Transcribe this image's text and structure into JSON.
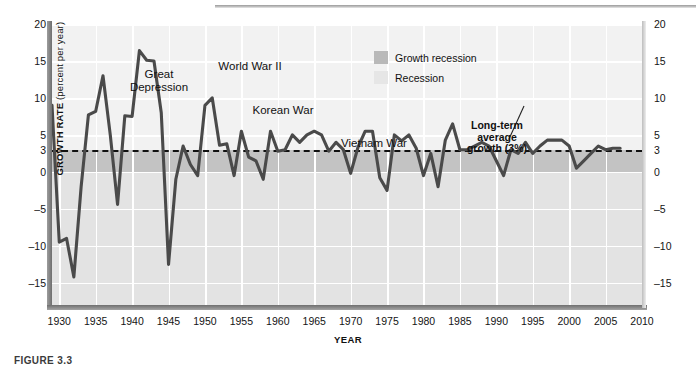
{
  "figure": {
    "caption": "FIGURE 3.3"
  },
  "axes": {
    "ylabel_bold": "GROWTH RATE",
    "ylabel_plain": " (percent per year)",
    "xlabel": "YEAR",
    "yticks": [
      20,
      15,
      10,
      5,
      3,
      0,
      -5,
      -10,
      -15
    ],
    "ytick_labels": [
      "20",
      "15",
      "10",
      "5",
      "3",
      "0",
      "–5",
      "–10",
      "–15"
    ],
    "xtick_labels": [
      "1930",
      "1935",
      "1940",
      "1945",
      "1950",
      "1955",
      "1960",
      "1965",
      "1970",
      "1975",
      "1980",
      "1985",
      "1990",
      "1995",
      "2000",
      "2005",
      "2010"
    ],
    "xticks": [
      1930,
      1935,
      1940,
      1945,
      1950,
      1955,
      1960,
      1965,
      1970,
      1975,
      1980,
      1985,
      1990,
      1995,
      2000,
      2005,
      2010
    ]
  },
  "legend": {
    "position": "top-center",
    "items": [
      {
        "label": "Growth recession",
        "swatch": "dark",
        "color": "#b9b9b9"
      },
      {
        "label": "Recession",
        "swatch": "light",
        "color": "#e6e6e6"
      }
    ]
  },
  "annotations": [
    {
      "id": "great-depression",
      "text": "Great\nDepression"
    },
    {
      "id": "world-war-ii",
      "text": "World War II"
    },
    {
      "id": "korean-war",
      "text": "Korean War"
    },
    {
      "id": "vietnam-war",
      "text": "Vietnam War"
    },
    {
      "id": "long-term-average",
      "text": "Long-term\naverage\ngrowth (3%)"
    }
  ],
  "colors": {
    "plot_background": "#ededed",
    "recession_band": "#e3e3e3",
    "growth_recession_band": "#c3c3c3",
    "above_band": "#f2f2f2",
    "gridline": "#ffffff",
    "series_line": "#4a4a4a",
    "average_line": "#111111",
    "axis": "#6f6f6f"
  },
  "chart_data": {
    "type": "line",
    "title": "",
    "subtitle": "",
    "xlabel": "YEAR",
    "ylabel": "GROWTH RATE (percent per year)",
    "xlim": [
      1929,
      2010
    ],
    "ylim": [
      -18,
      20
    ],
    "grid": true,
    "legend_position": "top-center",
    "reference_lines": [
      {
        "label": "Long-term average growth (3%)",
        "y": 3,
        "style": "dashed"
      }
    ],
    "bands": [
      {
        "label": "Growth recession",
        "from": 0,
        "to": 3,
        "color": "#c3c3c3"
      },
      {
        "label": "Recession",
        "from": -18,
        "to": 0,
        "color": "#e3e3e3"
      }
    ],
    "series": [
      {
        "name": "Real GDP growth rate",
        "x": [
          1929,
          1930,
          1931,
          1932,
          1933,
          1934,
          1935,
          1936,
          1937,
          1938,
          1939,
          1940,
          1941,
          1942,
          1943,
          1944,
          1945,
          1946,
          1947,
          1948,
          1949,
          1950,
          1951,
          1952,
          1953,
          1954,
          1955,
          1956,
          1957,
          1958,
          1959,
          1960,
          1961,
          1962,
          1963,
          1964,
          1965,
          1966,
          1967,
          1968,
          1969,
          1970,
          1971,
          1972,
          1973,
          1974,
          1975,
          1976,
          1977,
          1978,
          1979,
          1980,
          1981,
          1982,
          1983,
          1984,
          1985,
          1986,
          1987,
          1988,
          1989,
          1990,
          1991,
          1992,
          1993,
          1994,
          1995,
          1996,
          1997,
          1998,
          1999,
          2000,
          2001,
          2002,
          2003,
          2004,
          2005,
          2006,
          2007
        ],
        "values": [
          9.0,
          -9.5,
          -9.0,
          -14.2,
          -2.0,
          7.7,
          8.2,
          13.0,
          5.0,
          -4.4,
          7.6,
          7.5,
          16.4,
          15.1,
          15.0,
          8.0,
          -12.5,
          -1.0,
          3.5,
          1.0,
          -0.5,
          9.0,
          10.0,
          3.6,
          3.8,
          -0.5,
          5.5,
          2.0,
          1.5,
          -1.0,
          5.5,
          2.8,
          3.0,
          5.0,
          4.0,
          5.0,
          5.5,
          5.0,
          2.8,
          4.0,
          3.0,
          -0.2,
          3.3,
          5.5,
          5.5,
          -0.8,
          -2.5,
          5.0,
          4.2,
          5.0,
          3.2,
          -0.5,
          2.5,
          -2.0,
          4.3,
          6.5,
          3.0,
          3.0,
          3.5,
          4.0,
          3.5,
          1.5,
          -0.5,
          3.0,
          2.5,
          4.0,
          2.5,
          3.5,
          4.3,
          4.3,
          4.3,
          3.5,
          0.5,
          1.5,
          2.5,
          3.5,
          3.0,
          3.2,
          3.2
        ]
      }
    ]
  }
}
